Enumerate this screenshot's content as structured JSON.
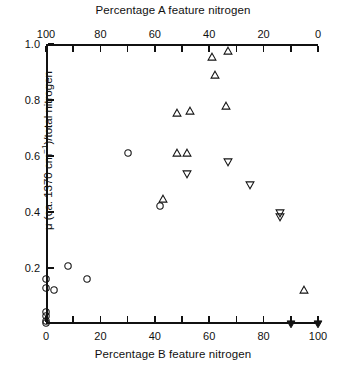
{
  "chart_data": {
    "type": "scatter",
    "title": "",
    "xlabel": "Percentage B feature nitrogen",
    "ylabel": "μ (ca. 1370 cm⁻¹)/total nitrogen",
    "top_axis_label": "Percentage A feature nitrogen",
    "xlim": [
      0,
      100
    ],
    "ylim": [
      0,
      1.0
    ],
    "grid": false,
    "legend": "none",
    "x_ticks": [
      0,
      20,
      40,
      60,
      80,
      100
    ],
    "x_tick_labels": [
      "0",
      "20",
      "40",
      "60",
      "80",
      "100"
    ],
    "x_minor_ticks": [
      10,
      30,
      50,
      70,
      90
    ],
    "top_ticks": [
      0,
      20,
      40,
      60,
      80,
      100
    ],
    "top_tick_labels": [
      "100",
      "80",
      "60",
      "40",
      "20",
      "0"
    ],
    "top_minor_ticks": [
      10,
      30,
      50,
      70,
      90
    ],
    "y_ticks": [
      0.2,
      0.4,
      0.6,
      0.8,
      1.0
    ],
    "y_tick_labels": [
      "0.2",
      "0.4",
      "0.6",
      "0.8",
      "1.0"
    ],
    "marker_color": "#141414",
    "series": [
      {
        "name": "open-circle",
        "marker": "circle-open",
        "points": [
          [
            0,
            0.16
          ],
          [
            0,
            0.128
          ],
          [
            0,
            0.042
          ],
          [
            0,
            0.03
          ],
          [
            0,
            0.012
          ],
          [
            0,
            0.004
          ],
          [
            3,
            0.122
          ],
          [
            8,
            0.208
          ],
          [
            15,
            0.16
          ],
          [
            30,
            0.612
          ],
          [
            42,
            0.422
          ]
        ]
      },
      {
        "name": "open-up-triangle",
        "marker": "triangle-up-open",
        "points": [
          [
            43,
            0.448
          ],
          [
            48,
            0.612
          ],
          [
            52,
            0.612
          ],
          [
            48,
            0.755
          ],
          [
            53,
            0.76
          ],
          [
            61,
            0.955
          ],
          [
            62,
            0.89
          ],
          [
            66,
            0.78
          ],
          [
            67,
            0.975
          ],
          [
            95,
            0.12
          ]
        ]
      },
      {
        "name": "open-down-triangle",
        "marker": "triangle-down-open",
        "points": [
          [
            52,
            0.535
          ],
          [
            67,
            0.578
          ],
          [
            75,
            0.495
          ],
          [
            86,
            0.398
          ],
          [
            86,
            0.382
          ]
        ]
      },
      {
        "name": "filled-down-triangle",
        "marker": "triangle-down-filled",
        "points": [
          [
            90,
            0.0
          ],
          [
            100,
            0.0
          ]
        ]
      }
    ]
  },
  "axes": {
    "top_title": "Percentage A feature nitrogen",
    "bottom_title": "Percentage B feature nitrogen",
    "y_title_prefix": "μ (ca. 1370 cm",
    "y_title_exp": "−1",
    "y_title_suffix": ")/total nitrogen"
  }
}
